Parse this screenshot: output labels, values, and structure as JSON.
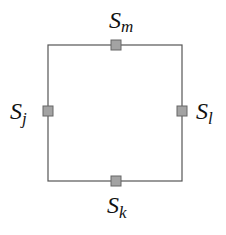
{
  "diagram": {
    "edges": [
      {
        "id": "top",
        "x1": 48,
        "y1": 45,
        "x2": 182,
        "y2": 45
      },
      {
        "id": "right",
        "x1": 182,
        "y1": 45,
        "x2": 182,
        "y2": 181
      },
      {
        "id": "bottom",
        "x1": 182,
        "y1": 181,
        "x2": 48,
        "y2": 181
      },
      {
        "id": "left",
        "x1": 48,
        "y1": 181,
        "x2": 48,
        "y2": 45
      }
    ],
    "nodes": [
      {
        "id": "m",
        "label_main": "S",
        "label_sub": "m"
      },
      {
        "id": "j",
        "label_main": "S",
        "label_sub": "j"
      },
      {
        "id": "l",
        "label_main": "S",
        "label_sub": "l"
      },
      {
        "id": "k",
        "label_main": "S",
        "label_sub": "k"
      }
    ],
    "colors": {
      "line": "#555555",
      "node_fill": "#a3a3a3",
      "node_stroke": "#666666"
    }
  }
}
